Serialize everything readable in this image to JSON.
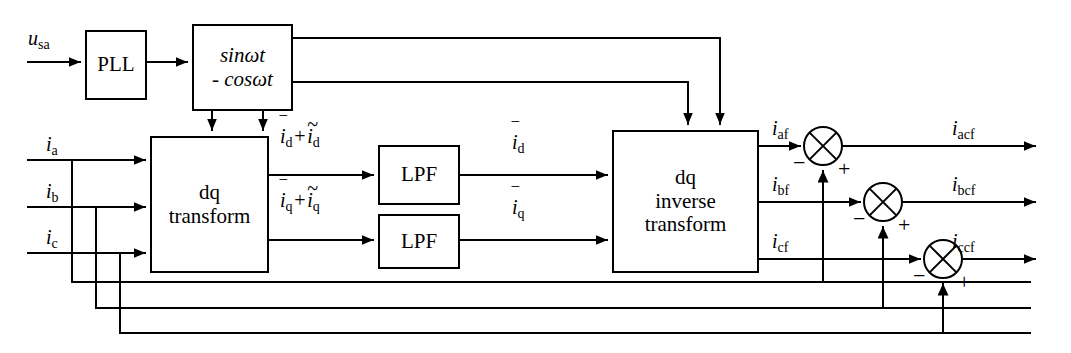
{
  "diagram": {
    "stroke_color": "#000000",
    "background_color": "#ffffff",
    "blocks": [
      {
        "id": "pll",
        "lines": [
          "PLL"
        ],
        "x": 85,
        "y": 30,
        "w": 62,
        "h": 70
      },
      {
        "id": "sincos",
        "lines": [
          "sinωt",
          "- cosωt"
        ],
        "x": 192,
        "y": 24,
        "w": 101,
        "h": 87
      },
      {
        "id": "dq_transform",
        "lines": [
          "dq",
          "transform"
        ],
        "x": 150,
        "y": 136,
        "w": 119,
        "h": 137
      },
      {
        "id": "lpf_d",
        "lines": [
          "LPF"
        ],
        "x": 378,
        "y": 145,
        "w": 82,
        "h": 60
      },
      {
        "id": "lpf_q",
        "lines": [
          "LPF"
        ],
        "x": 378,
        "y": 214,
        "w": 82,
        "h": 55
      },
      {
        "id": "dq_inverse",
        "lines": [
          "dq",
          "inverse",
          "transform"
        ],
        "x": 612,
        "y": 130,
        "w": 147,
        "h": 143
      }
    ],
    "signal_labels": [
      {
        "id": "u_sa",
        "base": "u",
        "sub": "sa",
        "x": 28,
        "y": 28
      },
      {
        "id": "i_a",
        "base": "i",
        "sub": "a",
        "x": 46,
        "y": 134
      },
      {
        "id": "i_b",
        "base": "i",
        "sub": "b",
        "x": 46,
        "y": 186
      },
      {
        "id": "i_c",
        "base": "i",
        "sub": "c",
        "x": 46,
        "y": 228
      },
      {
        "id": "i_d_sum",
        "base": "i",
        "sub": "d",
        "accent": "bar",
        "second_base": "i",
        "second_sub": "d",
        "second_accent": "tilde",
        "x": 280,
        "y": 125
      },
      {
        "id": "i_q_sum",
        "base": "i",
        "sub": "q",
        "accent": "bar",
        "second_base": "i",
        "second_sub": "q",
        "second_accent": "tilde",
        "x": 280,
        "y": 186
      },
      {
        "id": "i_d_bar",
        "base": "i",
        "sub": "d",
        "accent": "bar",
        "x": 512,
        "y": 131
      },
      {
        "id": "i_q_bar",
        "base": "i",
        "sub": "q",
        "accent": "bar",
        "x": 512,
        "y": 196
      },
      {
        "id": "i_af",
        "base": "i",
        "sub": "af",
        "x": 772,
        "y": 118
      },
      {
        "id": "i_bf",
        "base": "i",
        "sub": "bf",
        "x": 772,
        "y": 174
      },
      {
        "id": "i_cf",
        "base": "i",
        "sub": "cf",
        "x": 772,
        "y": 232
      },
      {
        "id": "i_acf",
        "base": "i",
        "sub": "acf",
        "x": 952,
        "y": 118
      },
      {
        "id": "i_bcf",
        "base": "i",
        "sub": "bcf",
        "x": 952,
        "y": 174
      },
      {
        "id": "i_ccf",
        "base": "i",
        "sub": "ccf",
        "x": 952,
        "y": 231
      }
    ],
    "plus_label": "+",
    "minus_label": "−",
    "summing_junctions": [
      {
        "id": "sum_a",
        "cx": 823,
        "cy": 146,
        "r": 19,
        "minus_x": 795,
        "minus_y": 158,
        "plus_x": 838,
        "plus_y": 166
      },
      {
        "id": "sum_b",
        "cx": 883,
        "cy": 202,
        "r": 19,
        "minus_x": 855,
        "minus_y": 214,
        "plus_x": 898,
        "plus_y": 222
      },
      {
        "id": "sum_c",
        "cx": 943,
        "cy": 259,
        "r": 19,
        "minus_x": 915,
        "minus_y": 271,
        "plus_x": 958,
        "plus_y": 279
      }
    ],
    "symbols": {
      "omega": "ω",
      "bar_accent": "‾",
      "tilde_accent": "~"
    }
  }
}
